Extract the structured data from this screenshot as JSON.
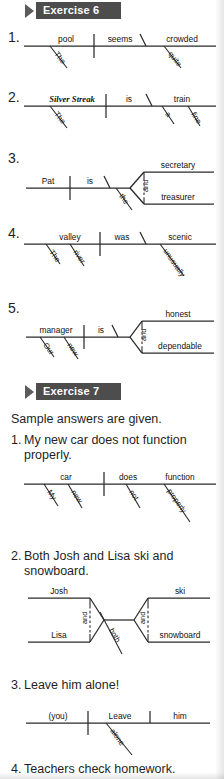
{
  "page": {
    "width": 224,
    "height": 779,
    "background": "#ffffff",
    "ink": "#1f1f1f",
    "badge_bg": "#4d4d4d",
    "badge_fg": "#ffffff",
    "arrow_color": "#5c5c5c"
  },
  "exercise6": {
    "badge_label": "Exercise 6",
    "items": [
      {
        "number": "1.",
        "diagram": {
          "type": "sentence-diagram",
          "pattern": "subject-linking-verb-predicate-adjective",
          "subject": "pool",
          "subject_modifiers": [
            "The"
          ],
          "verb": "seems",
          "complement": "crowded",
          "complement_modifiers": [
            "quite"
          ]
        }
      },
      {
        "number": "2.",
        "diagram": {
          "type": "sentence-diagram",
          "pattern": "subject-linking-verb-predicate-noun",
          "subject": "Silver Streak",
          "subject_italic": true,
          "subject_modifiers": [
            "The"
          ],
          "verb": "is",
          "complement": "train",
          "complement_modifiers": [
            "a",
            "fine"
          ]
        }
      },
      {
        "number": "3.",
        "diagram": {
          "type": "sentence-diagram",
          "pattern": "compound-predicate-noun",
          "subject": "Pat",
          "verb": "is",
          "complements": [
            "secretary",
            "treasurer"
          ],
          "conjunction": "and",
          "shared_modifier": "the"
        }
      },
      {
        "number": "4.",
        "diagram": {
          "type": "sentence-diagram",
          "pattern": "subject-linking-verb-predicate-adjective",
          "subject": "valley",
          "subject_modifiers": [
            "The",
            "river"
          ],
          "verb": "was",
          "complement": "scenic",
          "complement_modifiers": [
            "unusually"
          ]
        }
      },
      {
        "number": "5.",
        "diagram": {
          "type": "sentence-diagram",
          "pattern": "compound-predicate-adjective",
          "subject": "manager",
          "subject_modifiers": [
            "Our",
            "new"
          ],
          "verb": "is",
          "complements": [
            "honest",
            "dependable"
          ],
          "conjunction": "and"
        }
      }
    ]
  },
  "exercise7": {
    "badge_label": "Exercise 7",
    "note": "Sample answers are given.",
    "items": [
      {
        "number": "1.",
        "sentence_lines": [
          "My new car does not function",
          "properly."
        ],
        "diagram": {
          "type": "sentence-diagram",
          "pattern": "subject-verb-adverbs",
          "subject": "car",
          "subject_modifiers": [
            "My",
            "new"
          ],
          "verb_parts": [
            "does",
            "function"
          ],
          "verb_modifiers": [
            "not",
            "properly"
          ]
        }
      },
      {
        "number": "2.",
        "sentence_lines": [
          "Both Josh and Lisa ski and",
          "snowboard."
        ],
        "diagram": {
          "type": "sentence-diagram",
          "pattern": "compound-subject-compound-verb",
          "subjects": [
            "Josh",
            "Lisa"
          ],
          "subject_conjunction": "and",
          "subject_modifier": "both",
          "verbs": [
            "ski",
            "snowboard"
          ],
          "verb_conjunction": "and"
        }
      },
      {
        "number": "3.",
        "sentence_lines": [
          "Leave him alone!"
        ],
        "diagram": {
          "type": "sentence-diagram",
          "pattern": "imperative-subject-verb-object",
          "subject": "(you)",
          "verb": "Leave",
          "object": "him",
          "verb_modifiers": [
            "alone"
          ]
        }
      },
      {
        "number": "4.",
        "sentence_lines": [
          "Teachers check homework."
        ]
      }
    ]
  }
}
